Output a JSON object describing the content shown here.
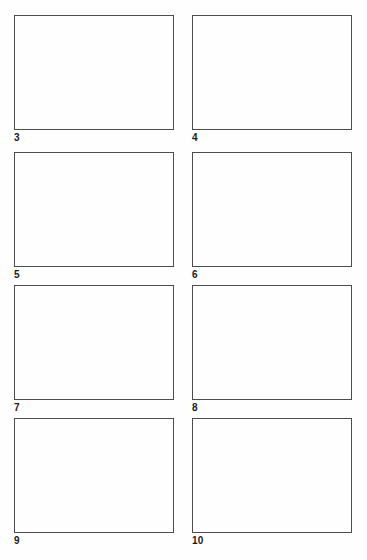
{
  "document": {
    "kind": "storyboard-sheet",
    "background_color": "#fefefe",
    "frame_border_color": "#4c4c4c",
    "label_color": "#1a1a1a"
  },
  "panels": [
    {
      "label": "3",
      "column": "left",
      "row": 1,
      "content": ""
    },
    {
      "label": "4",
      "column": "right",
      "row": 1,
      "content": ""
    },
    {
      "label": "5",
      "column": "left",
      "row": 2,
      "content": ""
    },
    {
      "label": "6",
      "column": "right",
      "row": 2,
      "content": ""
    },
    {
      "label": "7",
      "column": "left",
      "row": 3,
      "content": ""
    },
    {
      "label": "8",
      "column": "right",
      "row": 3,
      "content": ""
    },
    {
      "label": "9",
      "column": "left",
      "row": 4,
      "content": ""
    },
    {
      "label": "10",
      "column": "right",
      "row": 4,
      "content": ""
    }
  ]
}
